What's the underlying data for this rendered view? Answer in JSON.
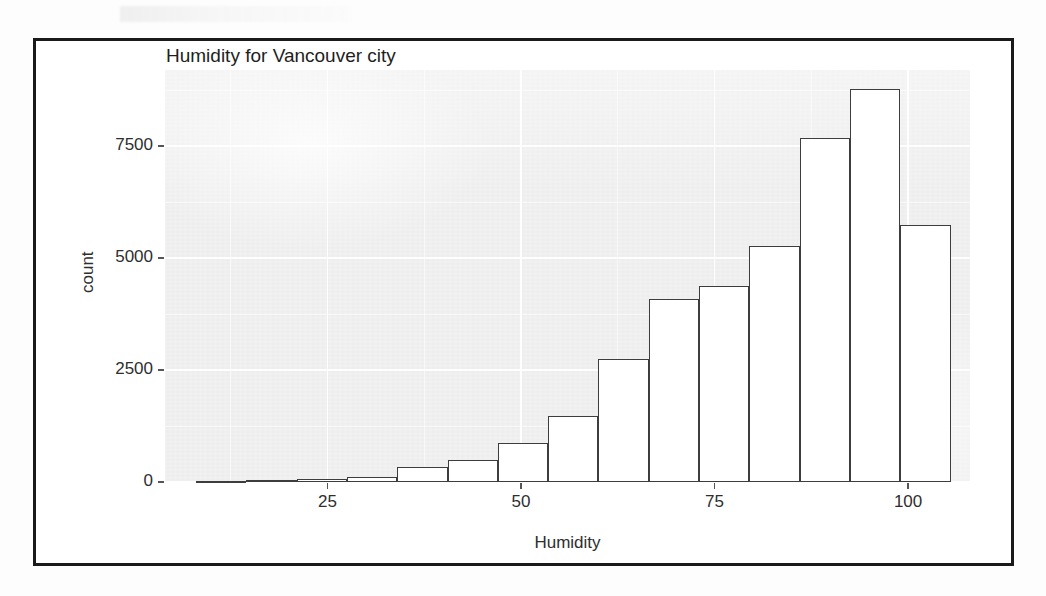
{
  "figure": {
    "title": "Humidity for Vancouver city",
    "frame_color": "#1a1a1a",
    "panel_color": "#ebebeb",
    "bar_fill": "#ffffff",
    "bar_outline": "#3d3d3d"
  },
  "chart_data": {
    "type": "bar",
    "title": "Humidity for Vancouver city",
    "xlabel": "Humidity",
    "ylabel": "count",
    "xlim": [
      4,
      108
    ],
    "ylim": [
      0,
      9200
    ],
    "grid": true,
    "legend": null,
    "bin_width": 6.5,
    "x_ticks": [
      25,
      50,
      75,
      100
    ],
    "x_tick_labels": [
      "25",
      "50",
      "75",
      "100"
    ],
    "y_ticks": [
      0,
      2500,
      5000,
      7500
    ],
    "y_tick_labels": [
      "0",
      "2500",
      "5000",
      "7500"
    ],
    "x_minor_ticks": [
      12.5,
      37.5,
      62.5,
      87.5
    ],
    "y_minor_ticks": [
      1250,
      3750,
      6250,
      8750
    ],
    "bin_centers": [
      11.3,
      17.8,
      24.3,
      30.8,
      37.3,
      43.8,
      50.3,
      56.8,
      63.3,
      69.8,
      76.3,
      82.8,
      89.3,
      95.8,
      102.3
    ],
    "bin_edges": [
      8.0,
      14.5,
      21.0,
      27.5,
      34.0,
      40.5,
      47.0,
      53.5,
      60.0,
      66.5,
      73.0,
      79.5,
      86.0,
      92.5,
      99.0,
      105.5
    ],
    "categories": [
      "8-14.5",
      "14.5-21",
      "21-27.5",
      "27.5-34",
      "34-40.5",
      "40.5-47",
      "47-53.5",
      "53.5-60",
      "60-66.5",
      "66.5-73",
      "73-79.5",
      "79.5-86",
      "86-92.5",
      "92.5-99",
      "99-105.5"
    ],
    "values": [
      20,
      40,
      60,
      120,
      330,
      500,
      880,
      1480,
      2740,
      4080,
      4380,
      5280,
      7680,
      8770,
      5740
    ]
  },
  "annotations": {
    "y_axis_title": "count",
    "x_axis_title": "Humidity"
  }
}
